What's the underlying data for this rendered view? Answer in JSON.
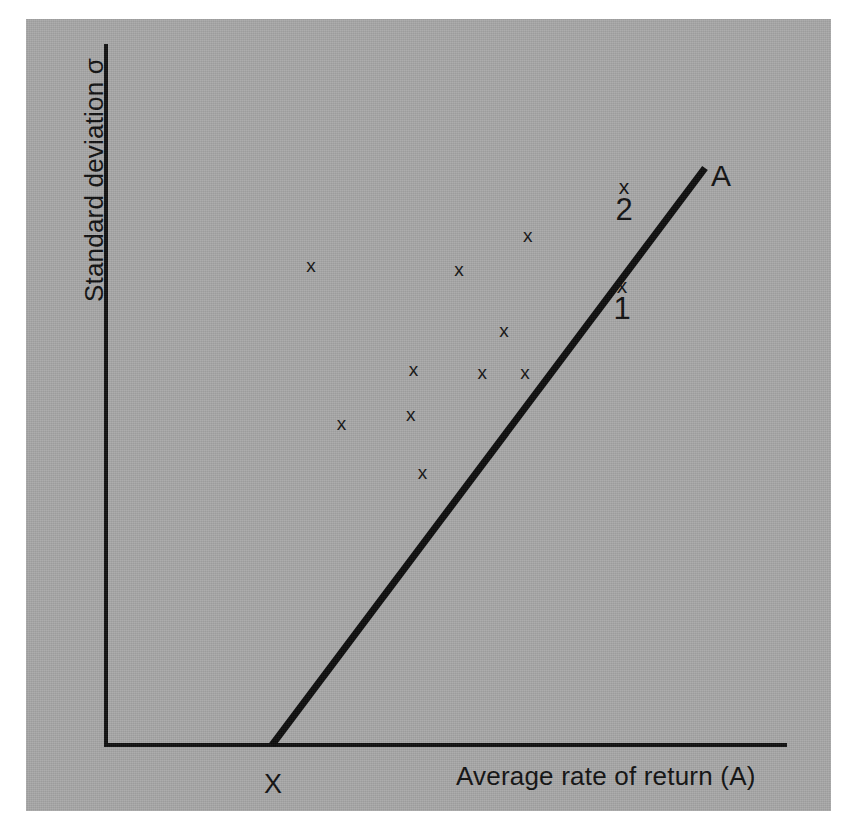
{
  "figure": {
    "background_color": "#ffffff",
    "panel_color": "#a8a8a8",
    "ink_color": "#111111"
  },
  "axes": {
    "y_label": "Standard deviation σ",
    "x_label": "Average rate of return (A)",
    "origin_label": "X"
  },
  "line": {
    "end_label": "A"
  },
  "marked_points": [
    {
      "marker": "x",
      "label": "2"
    },
    {
      "marker": "x",
      "label": "1"
    }
  ],
  "scatter_marker": "x",
  "chart_data": {
    "type": "scatter",
    "title": "",
    "xlabel": "Average rate of return (A)",
    "ylabel": "Standard deviation σ",
    "grid": false,
    "legend": null,
    "axis_style": "two-axis L-frame, no tick marks, no numeric tick labels",
    "xlim": [
      0,
      100
    ],
    "ylim": [
      0,
      100
    ],
    "note": "Coordinates below are expressed in percent of the plotted axis extent: x from the y-axis (0) to the right end of the x-axis (100); y from the x-axis (0) up to the top of the y-axis (100).",
    "series": [
      {
        "name": "portfolios",
        "marker": "x",
        "points": [
          {
            "x": 30.2,
            "y": 68.6
          },
          {
            "x": 52.0,
            "y": 68.1
          },
          {
            "x": 62.1,
            "y": 73.0
          },
          {
            "x": 58.6,
            "y": 59.3
          },
          {
            "x": 55.4,
            "y": 53.3
          },
          {
            "x": 61.7,
            "y": 53.3
          },
          {
            "x": 45.3,
            "y": 53.8
          },
          {
            "x": 34.7,
            "y": 46.0
          },
          {
            "x": 44.9,
            "y": 47.3
          },
          {
            "x": 46.6,
            "y": 39.0
          }
        ]
      },
      {
        "name": "labelled points on line A",
        "marker": "x",
        "points": [
          {
            "x": 75.6,
            "y": 76.0,
            "label": "2"
          },
          {
            "x": 75.1,
            "y": 64.0,
            "label": "1"
          }
        ]
      }
    ],
    "annotations": [
      {
        "text": "A",
        "x": 88.5,
        "y": 83.0,
        "role": "line-end-label"
      },
      {
        "text": "X",
        "x": 24.4,
        "y": -3.5,
        "role": "line-origin-label"
      }
    ],
    "line_of_fit": {
      "label": "A",
      "from": {
        "x": 24.4,
        "y": 0.0
      },
      "to": {
        "x": 86.1,
        "y": 82.6
      }
    }
  }
}
